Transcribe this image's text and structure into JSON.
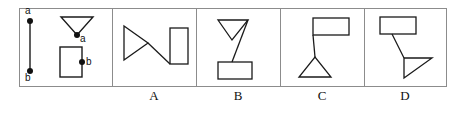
{
  "figure": {
    "type": "geometry-multiple-choice",
    "frame": {
      "x": 19,
      "y": 8,
      "width": 428,
      "height": 79,
      "stroke": "#8c8c8c",
      "stroke_width": 1
    },
    "shape_stroke": "#1a1a1a",
    "shape_fill": "none",
    "dot_color": "#111111",
    "dividers": [
      112,
      196,
      280,
      364
    ],
    "reference_panel": {
      "name": "reference",
      "x": 19,
      "width": 93,
      "segment": {
        "label_top": "a",
        "label_bottom": "b",
        "x": 30,
        "y_top": 21,
        "y_bottom": 71,
        "dot_radius": 3
      },
      "triangle": {
        "orientation": "pointing-down",
        "points": "61,17 93,17 77,35",
        "vertex_label": "a",
        "vertex_dot": {
          "x": 77,
          "y": 35,
          "r": 3
        },
        "label_pos": {
          "x": 80,
          "y": 36
        }
      },
      "rectangle": {
        "x": 60,
        "y": 47,
        "width": 22,
        "height": 30,
        "point_label": "b",
        "point_dot": {
          "x": 82,
          "y": 62,
          "r": 3
        },
        "label_pos": {
          "x": 85,
          "y": 63
        }
      }
    },
    "options": [
      {
        "label": "A",
        "x": 112,
        "width": 84,
        "label_pos": {
          "x": 134,
          "y": 92
        },
        "triangle": {
          "orientation": "pointing-right",
          "points": "124,26 124,60 148,43"
        },
        "rectangle": {
          "x": 170,
          "y": 28,
          "width": 18,
          "height": 36
        },
        "connector": {
          "x1": 148,
          "y1": 43,
          "x2": 170,
          "y2": 64
        }
      },
      {
        "label": "B",
        "x": 196,
        "width": 84,
        "label_pos": {
          "x": 218,
          "y": 92
        },
        "triangle": {
          "orientation": "pointing-down",
          "points": "218,20 248,20 232,40"
        },
        "rectangle": {
          "x": 218,
          "y": 62,
          "width": 34,
          "height": 17
        },
        "connector": {
          "x1": 248,
          "y1": 20,
          "x2": 232,
          "y2": 62
        }
      },
      {
        "label": "C",
        "x": 280,
        "width": 84,
        "label_pos": {
          "x": 302,
          "y": 92
        },
        "triangle": {
          "orientation": "pointing-up",
          "points": "299,77 331,77 315,57"
        },
        "rectangle": {
          "x": 313,
          "y": 18,
          "width": 36,
          "height": 17
        },
        "connector": {
          "x1": 313,
          "y1": 35,
          "x2": 315,
          "y2": 57
        }
      },
      {
        "label": "D",
        "x": 364,
        "width": 83,
        "label_pos": {
          "x": 386,
          "y": 92
        },
        "rectangle": {
          "x": 380,
          "y": 17,
          "width": 36,
          "height": 17
        },
        "triangle": {
          "orientation": "pointing-right",
          "points": "404,58 432,58 404,78"
        },
        "connector": {
          "x1": 392,
          "y1": 34,
          "x2": 404,
          "y2": 58
        }
      }
    ]
  }
}
